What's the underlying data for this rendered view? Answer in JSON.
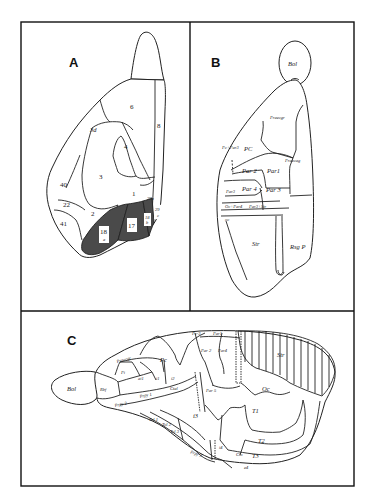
{
  "figure": {
    "panels": [
      {
        "id": "A",
        "letter": "A",
        "labels": {
          "l6": "6",
          "l8": "8",
          "l3d": "3d",
          "l4": "4",
          "l3": "3",
          "l40": "40",
          "l1": "1",
          "l22": "22",
          "l2": "2",
          "l41": "41",
          "l18a_num": "18",
          "l18a_sub": "a",
          "l17": "17",
          "l18b_num": "18",
          "l18b_sub": "b",
          "l29a": "29a",
          "l29c_num": "29",
          "l29c_sub": "c"
        },
        "shaded_regions": [
          "18a",
          "17",
          "18b"
        ],
        "shade_color": "#4a4a4a"
      },
      {
        "id": "B",
        "letter": "B",
        "labels": {
          "bol": "Bol",
          "praecgr": "Praecgr",
          "pc_par3": "Pc+Par3",
          "pc": "PC",
          "praecag": "Praecag",
          "par2": "Par 2",
          "par1": "Par1",
          "par4": "Par 4",
          "par3_small": "Par3",
          "par3": "Par 3",
          "oc_par4": "Oc+Par4",
          "par3_str": "Par3+Str",
          "oc": "oc",
          "str": "Str",
          "rsgp": "Rsg P"
        }
      },
      {
        "id": "C",
        "letter": "C",
        "labels": {
          "bol": "Bol",
          "praecgr": "Praecgr",
          "pc": "Pc",
          "par2": "Par 2",
          "par4": "Par4",
          "pc3": "Pc-3",
          "par1": "Par1",
          "par5": "Par 5",
          "str": "Str",
          "oc": "Oc",
          "rbf": "Rbf",
          "pi": "Pi",
          "ai1": "ai1",
          "i1": "i1",
          "i2": "i2",
          "ctal": "Ctal",
          "prpy1": "Prpy 1",
          "prpy2": "Prpy 2",
          "tol1": "Tol 1",
          "tol2": "Tol 2",
          "tol3": "Tol 3",
          "i3": "i3",
          "i4": "i4",
          "t1": "T1",
          "t2": "T2",
          "t3": "T3",
          "prpy3": "Prpy 3",
          "clo": "Clo",
          "e4": "e4"
        }
      }
    ]
  }
}
